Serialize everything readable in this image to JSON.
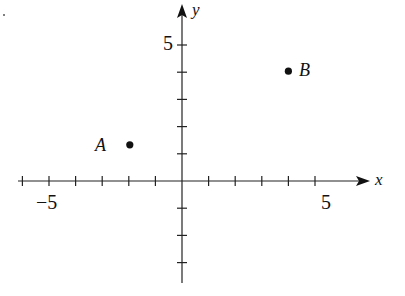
{
  "diagram": {
    "type": "coordinate-plane",
    "axes": {
      "x_label": "x",
      "y_label": "y",
      "x_range": [
        -6,
        7
      ],
      "y_range": [
        -4,
        5.5
      ],
      "x_tick_labels": [
        {
          "value": -5,
          "text": "−5"
        },
        {
          "value": 5,
          "text": "5"
        }
      ],
      "y_tick_labels": [
        {
          "value": 5,
          "text": "5"
        }
      ],
      "tick_step": 1
    },
    "points": [
      {
        "name": "A",
        "x": -2,
        "y": 1
      },
      {
        "name": "B",
        "x": 4,
        "y": 4
      }
    ],
    "colors": {
      "ink": "#111111",
      "background": "#ffffff"
    }
  }
}
